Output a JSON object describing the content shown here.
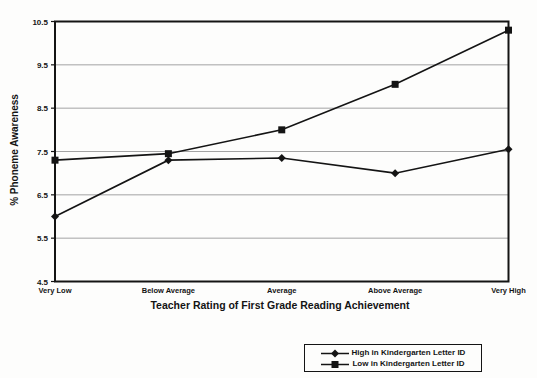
{
  "chart_data": {
    "type": "line",
    "title": "",
    "xlabel": "Teacher Rating of First Grade Reading Achievement",
    "ylabel": "% Phoneme Awareness",
    "categories": [
      "Very Low",
      "Below Average",
      "Average",
      "Above Average",
      "Very High"
    ],
    "series": [
      {
        "name": "High in Kindergarten Letter ID",
        "marker": "diamond",
        "values": [
          6.0,
          7.3,
          7.35,
          7.0,
          7.55
        ]
      },
      {
        "name": "Low in Kindergarten Letter ID",
        "marker": "square",
        "values": [
          7.3,
          7.45,
          8.0,
          9.05,
          10.3
        ]
      }
    ],
    "ylim": [
      4.5,
      10.5
    ],
    "yticks": [
      4.5,
      5.5,
      6.5,
      7.5,
      8.5,
      9.5,
      10.5
    ],
    "grid": "horizontal gridlines on",
    "legend_position": "bottom-right outside plot",
    "line_color": "#141414",
    "grid_color": "#9a9a9a",
    "background_color": "#fdfdfc"
  }
}
